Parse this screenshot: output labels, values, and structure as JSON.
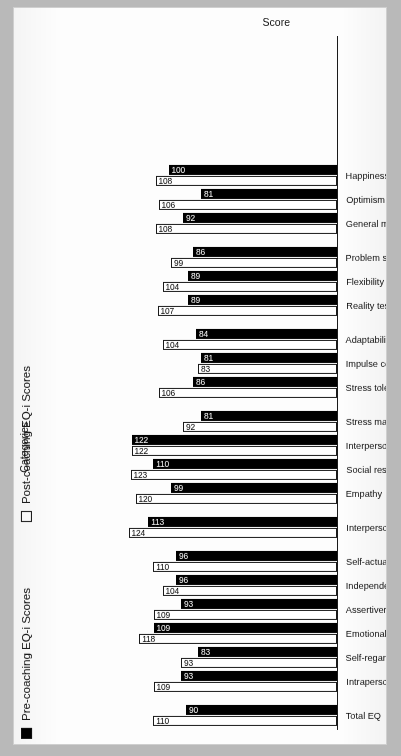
{
  "figure": {
    "xlabel": "Score",
    "ylabel": "Categories",
    "legend": {
      "pre_label": "Pre-coaching EQ-i Scores",
      "post_label": "Post-coaching EQ-i Scores",
      "pre_color": "#000000",
      "post_color": "#ffffff"
    }
  },
  "chart_data": {
    "type": "bar",
    "orientation": "horizontal",
    "title": "",
    "subtitle": "",
    "xlabel": "Score",
    "ylabel": "Categories",
    "grid": false,
    "legend_position": "left",
    "xlim": [
      0,
      130
    ],
    "categories": [
      "Total EQ",
      "Intrapersonal",
      "Self-regard",
      "Emotional self-awareness",
      "Assertiveness",
      "Independence",
      "Self-actualisation",
      "Interpersonal",
      "Empathy",
      "Social responsibility",
      "Interpersonal relationship",
      "Stress management",
      "Stress tolerance",
      "Impulse control",
      "Adaptability",
      "Reality testing",
      "Flexibility",
      "Problem solving",
      "General mood",
      "Optimism",
      "Happiness"
    ],
    "series": [
      {
        "name": "Pre-coaching EQ-i Scores",
        "color": "#000000",
        "values": [
          90,
          93,
          83,
          109,
          93,
          96,
          96,
          113,
          99,
          110,
          122,
          81,
          86,
          81,
          84,
          89,
          89,
          86,
          92,
          81,
          100
        ]
      },
      {
        "name": "Post-coaching EQ-i Scores",
        "color": "#ffffff",
        "values": [
          110,
          109,
          93,
          118,
          109,
          104,
          110,
          124,
          120,
          123,
          122,
          92,
          106,
          83,
          104,
          107,
          104,
          99,
          108,
          106,
          108
        ]
      }
    ],
    "group_gaps_after": [
      "Total EQ",
      "Self-actualisation",
      "Interpersonal",
      "Stress management",
      "Adaptability",
      "Problem solving"
    ]
  }
}
